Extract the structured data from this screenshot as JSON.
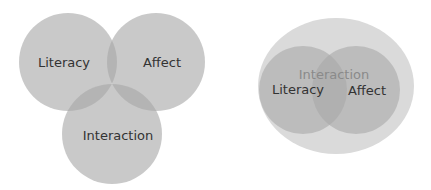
{
  "diagrams": [
    {
      "name": "overlapping-venn",
      "circles": [
        {
          "label": "Literacy",
          "cx": 68,
          "cy": 62,
          "r": 49,
          "fill": "#b9b9b9"
        },
        {
          "label": "Affect",
          "cx": 156,
          "cy": 62,
          "r": 49,
          "fill": "#b9b9b9"
        },
        {
          "label": "Interaction",
          "cx": 112,
          "cy": 134,
          "r": 50,
          "fill": "#b9b9b9"
        }
      ]
    },
    {
      "name": "nested-venn",
      "outer": {
        "label": "Interaction",
        "cx": 336,
        "cy": 86,
        "rx": 78,
        "ry": 68,
        "fill": "#dcdcdc",
        "label_color": "#8a8a8a"
      },
      "circles": [
        {
          "label": "Literacy",
          "cx": 303,
          "cy": 90,
          "r": 44,
          "fill": "#bdbdbd"
        },
        {
          "label": "Affect",
          "cx": 356,
          "cy": 90,
          "r": 44,
          "fill": "#bdbdbd"
        }
      ]
    }
  ],
  "colors": {
    "text": "#2e2e2e",
    "background": "#ffffff"
  }
}
